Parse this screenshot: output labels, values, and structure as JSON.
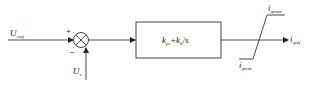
{
  "diagram": {
    "type": "control-block-diagram",
    "inputs": {
      "reference": {
        "symbol": "U",
        "subscript": "sref"
      },
      "feedback": {
        "symbol": "U",
        "subscript": "s"
      }
    },
    "summing_junction": {
      "plus_sign": "+",
      "minus_sign": "−"
    },
    "controller_block": {
      "k1": "k",
      "k1_sub": "pt",
      "plus": "+",
      "k2": "k",
      "k2_sub": "it",
      "divisor": "/s"
    },
    "limiter": {
      "upper": {
        "symbol": "i",
        "subscript": "qmax"
      },
      "lower": {
        "symbol": "i",
        "subscript": "qmin"
      }
    },
    "output": {
      "symbol": "i",
      "subscript": "qref"
    },
    "colors": {
      "line": "#333333",
      "background": "#ffffff"
    }
  }
}
